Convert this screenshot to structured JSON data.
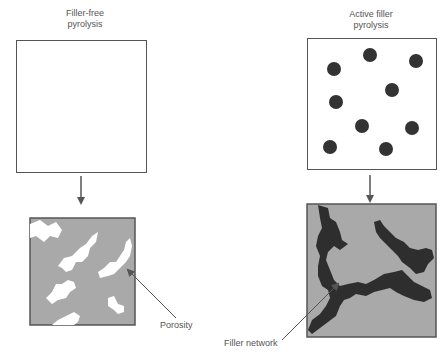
{
  "panels": {
    "left": {
      "title_line1": "Filler-free",
      "title_line2": "pyrolysis",
      "callout": "Porosity"
    },
    "right": {
      "title_line1": "Active filler",
      "title_line2": "pyrolysis",
      "callout": "Filler network"
    }
  },
  "colors": {
    "matrix_gray": "#a9a9a9",
    "filler_dark": "#2e2e2e",
    "border": "#555555",
    "pore_white": "#ffffff"
  }
}
